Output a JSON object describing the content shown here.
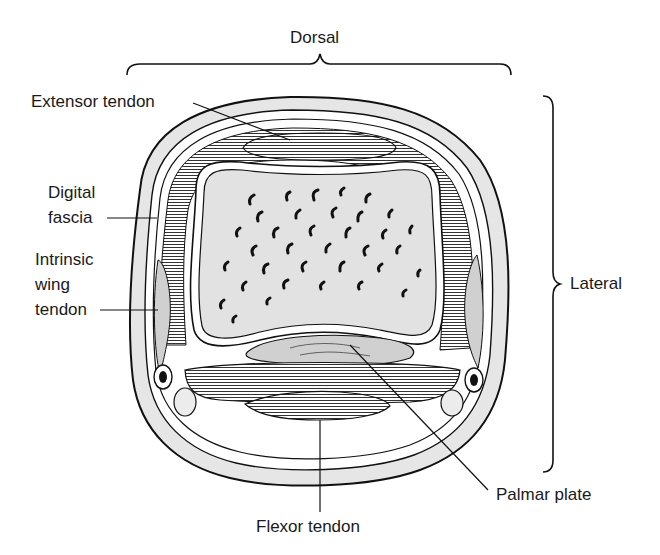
{
  "diagram": {
    "orientation_labels": {
      "dorsal": "Dorsal",
      "lateral": "Lateral"
    },
    "labels": {
      "extensor_tendon": "Extensor tendon",
      "digital_fascia_line1": "Digital",
      "digital_fascia_line2": "fascia",
      "intrinsic_wing_tendon_line1": "Intrinsic",
      "intrinsic_wing_tendon_line2": "wing",
      "intrinsic_wing_tendon_line3": "tendon",
      "palmar_plate": "Palmar plate",
      "flexor_tendon": "Flexor tendon"
    },
    "colors": {
      "outline": "#111111",
      "skin_fill": "#e6e6e6",
      "bone_fill": "#e2e2e2",
      "tendon_fill": "#d0d0d0",
      "background": "#ffffff"
    }
  }
}
